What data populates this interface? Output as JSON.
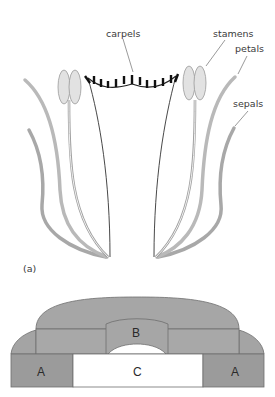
{
  "diagram": {
    "part_a": {
      "panel_label": "(a)",
      "labels": {
        "carpels": "carpels",
        "stamens": "stamens",
        "petals": "petals",
        "sepals": "sepals"
      }
    },
    "part_b": {
      "regions": {
        "left_outer": "A",
        "right_outer": "A",
        "middle_ring": "B",
        "center": "C"
      }
    },
    "colors": {
      "sepal": "#a8a8a8",
      "petal": "#b9b9b9",
      "stamen_fill": "#e2e2e2",
      "stamen_stroke": "#9a9a9a",
      "carpel_line": "#222222",
      "region_a": "#9b9b9b",
      "region_b": "#a6a6a6",
      "region_c": "#ffffff"
    }
  }
}
